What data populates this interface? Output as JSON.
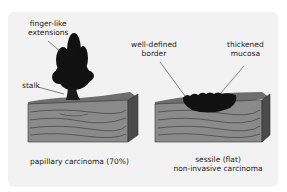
{
  "diagram": {
    "left": {
      "caption": "papillary carcinoma (70%)",
      "labels": {
        "fingers_line1": "finger-like",
        "fingers_line2": "extensions",
        "stalk": "stalk"
      }
    },
    "right": {
      "caption_line1": "sessile (flat)",
      "caption_line2": "non-invasive carcinoma",
      "labels": {
        "border_line1": "well-defined",
        "border_line2": "border",
        "mucosa_line1": "thickened",
        "mucosa_line2": "mucosa"
      }
    },
    "colors": {
      "panel_bg": "#f2f2f2",
      "tissue_top": "#7a7a7a",
      "tissue_front": "#8c8c8c",
      "tissue_side": "#555555",
      "tumor": "#111111"
    }
  }
}
